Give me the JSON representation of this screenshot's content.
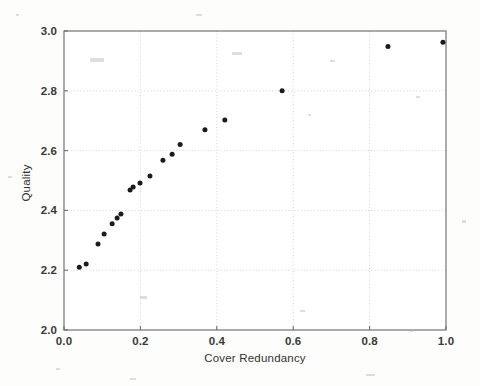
{
  "figure": {
    "background_color": "#fdfdfc",
    "frame_color": "#6e6e6e",
    "grid_color": "#c9c9c9",
    "marker_color": "#1b1b1b"
  },
  "chart_data": {
    "type": "scatter",
    "title": "",
    "subtitle": "",
    "xlabel": "Cover Redundancy",
    "ylabel": "Quality",
    "xlim": [
      0.0,
      1.0
    ],
    "ylim": [
      2.0,
      3.0
    ],
    "xticks": [
      0.0,
      0.2,
      0.4,
      0.6,
      0.8,
      1.0
    ],
    "yticks": [
      2.0,
      2.2,
      2.4,
      2.6,
      2.8,
      3.0
    ],
    "xtick_labels": [
      "0.0",
      "0.2",
      "0.4",
      "0.6",
      "0.8",
      "1.0"
    ],
    "ytick_labels": [
      "2.0",
      "2.2",
      "2.4",
      "2.6",
      "2.8",
      "3.0"
    ],
    "grid": true,
    "grid_style": "dotted",
    "legend": null,
    "legend_position": "none",
    "annotations": [],
    "marker": "circle",
    "marker_size": 5,
    "series": [
      {
        "name": "Quality vs Cover Redundancy",
        "x": [
          0.04,
          0.058,
          0.089,
          0.105,
          0.126,
          0.139,
          0.149,
          0.173,
          0.181,
          0.199,
          0.225,
          0.259,
          0.283,
          0.304,
          0.369,
          0.421,
          0.571,
          0.848,
          0.992
        ],
        "y": [
          2.21,
          2.221,
          2.288,
          2.321,
          2.355,
          2.375,
          2.388,
          2.468,
          2.478,
          2.492,
          2.515,
          2.568,
          2.588,
          2.62,
          2.67,
          2.702,
          2.8,
          2.948,
          2.962
        ]
      }
    ]
  },
  "labels": {
    "xaxis_title": "Cover Redundancy",
    "yaxis_title": "Quality"
  }
}
